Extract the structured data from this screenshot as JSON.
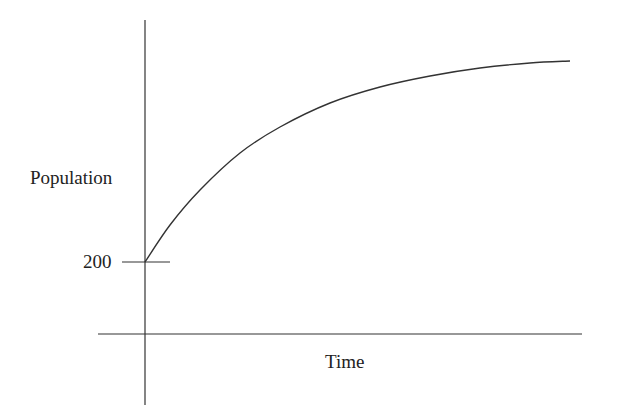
{
  "chart_data": {
    "type": "line",
    "title": "",
    "xlabel": "Time",
    "ylabel": "Population",
    "y_tick_labels": [
      "200"
    ],
    "x_tick_labels": [],
    "grid": false,
    "legend": null,
    "series": [
      {
        "name": "Population",
        "description": "Concave-down growth starting at 200 and leveling off toward a horizontal asymptote (logistic/limited growth)",
        "start_value": 200,
        "points_px": [
          [
            145,
            262
          ],
          [
            170,
            225
          ],
          [
            200,
            190
          ],
          [
            240,
            153
          ],
          [
            280,
            127
          ],
          [
            330,
            103
          ],
          [
            380,
            87
          ],
          [
            430,
            76
          ],
          [
            480,
            68
          ],
          [
            530,
            63
          ],
          [
            570,
            61
          ]
        ]
      }
    ],
    "colors": {
      "line": "#333333",
      "axes": "#333333",
      "background": "#ffffff"
    }
  }
}
